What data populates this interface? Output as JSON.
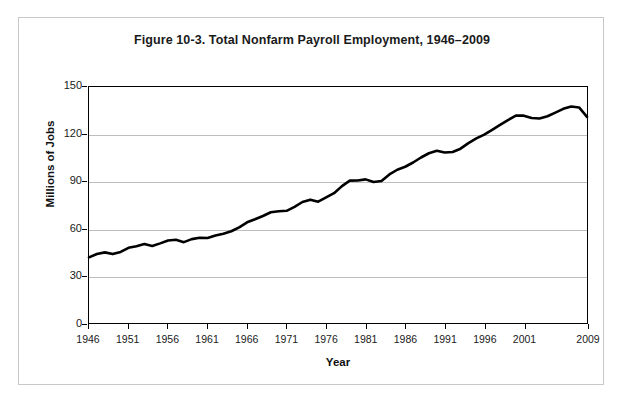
{
  "figure": {
    "title": "Figure 10-3. Total Nonfarm Payroll Employment, 1946–2009"
  },
  "chart_data": {
    "type": "line",
    "title": "Figure 10-3. Total Nonfarm Payroll Employment, 1946–2009",
    "xlabel": "Year",
    "ylabel": "Millions of Jobs",
    "xlim": [
      1946,
      2009
    ],
    "ylim": [
      0,
      150
    ],
    "grid": true,
    "legend": null,
    "line_color": "#000000",
    "line_width": 2.6,
    "y_ticks": [
      0,
      30,
      60,
      90,
      120,
      150
    ],
    "y_tick_labels": [
      "0",
      "30",
      "60",
      "90",
      "120",
      "150"
    ],
    "x_ticks": [
      1946,
      1951,
      1956,
      1961,
      1966,
      1971,
      1976,
      1981,
      1986,
      1991,
      1996,
      2001,
      2009
    ],
    "x_tick_labels": [
      "1946",
      "1951",
      "1956",
      "1961",
      "1966",
      "1971",
      "1976",
      "1981",
      "1986",
      "1991",
      "1996",
      "2001",
      "2009"
    ],
    "x": [
      1946,
      1947,
      1948,
      1949,
      1950,
      1951,
      1952,
      1953,
      1954,
      1955,
      1956,
      1957,
      1958,
      1959,
      1960,
      1961,
      1962,
      1963,
      1964,
      1965,
      1966,
      1967,
      1968,
      1969,
      1970,
      1971,
      1972,
      1973,
      1974,
      1975,
      1976,
      1977,
      1978,
      1979,
      1980,
      1981,
      1982,
      1983,
      1984,
      1985,
      1986,
      1987,
      1988,
      1989,
      1990,
      1991,
      1992,
      1993,
      1994,
      1995,
      1996,
      1997,
      1998,
      1999,
      2000,
      2001,
      2002,
      2003,
      2004,
      2005,
      2006,
      2007,
      2008,
      2009
    ],
    "values": [
      41.7,
      43.9,
      44.9,
      43.8,
      45.2,
      47.8,
      48.8,
      50.2,
      49.0,
      50.6,
      52.4,
      52.9,
      51.4,
      53.3,
      54.2,
      54.0,
      55.6,
      56.7,
      58.3,
      60.8,
      64.0,
      65.9,
      68.0,
      70.4,
      71.0,
      71.3,
      73.8,
      76.9,
      78.4,
      77.1,
      79.8,
      82.5,
      87.0,
      90.5,
      90.6,
      91.3,
      89.6,
      90.2,
      94.4,
      97.4,
      99.3,
      102.0,
      105.2,
      107.9,
      109.5,
      108.4,
      108.7,
      110.8,
      114.3,
      117.3,
      119.7,
      122.8,
      125.9,
      129.0,
      131.8,
      131.8,
      130.3,
      130.0,
      131.4,
      133.7,
      136.1,
      137.6,
      137.0,
      131.0
    ]
  },
  "axis": {
    "y_title": "Millions of Jobs",
    "x_title": "Year"
  }
}
